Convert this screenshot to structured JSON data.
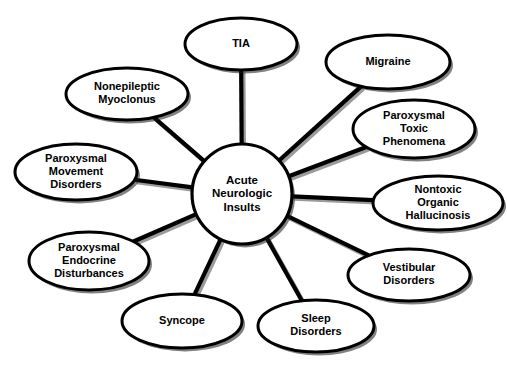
{
  "diagram": {
    "type": "hub-and-spoke-concept-map",
    "background_color": "#ffffff",
    "stroke_color": "#000000",
    "shadow_color": "#1a1a1a",
    "connector_shadow_color": "#8a8a8a",
    "canvas": {
      "width": 507,
      "height": 370
    },
    "hub": {
      "id": "hub-acute-neurologic-insults",
      "label_lines": [
        "Acute",
        "Neurologic",
        "Insults"
      ],
      "label": "Acute Neurologic Insults",
      "shape": "circle",
      "cx": 242,
      "cy": 194,
      "r": 50
    },
    "nodes": [
      {
        "id": "node-tia",
        "label": "TIA",
        "label_lines": [
          "TIA"
        ],
        "shape": "ellipse",
        "cx": 241,
        "cy": 44,
        "rx": 56,
        "ry": 26
      },
      {
        "id": "node-migraine",
        "label": "Migraine",
        "label_lines": [
          "Migraine"
        ],
        "shape": "ellipse",
        "cx": 388,
        "cy": 62,
        "rx": 62,
        "ry": 27
      },
      {
        "id": "node-paroxysmal-toxic-phenomena",
        "label": "Paroxysmal Toxic Phenomena",
        "label_lines": [
          "Paroxysmal",
          "Toxic",
          "Phenomena"
        ],
        "shape": "ellipse",
        "cx": 414,
        "cy": 129,
        "rx": 61,
        "ry": 29
      },
      {
        "id": "node-nontoxic-organic-hallucinosis",
        "label": "Nontoxic Organic Hallucinosis",
        "label_lines": [
          "Nontoxic",
          "Organic",
          "Hallucinosis"
        ],
        "shape": "ellipse",
        "cx": 438,
        "cy": 203,
        "rx": 65,
        "ry": 27
      },
      {
        "id": "node-vestibular-disorders",
        "label": "Vestibular Disorders",
        "label_lines": [
          "Vestibular",
          "Disorders"
        ],
        "shape": "ellipse",
        "cx": 409,
        "cy": 275,
        "rx": 61,
        "ry": 26
      },
      {
        "id": "node-sleep-disorders",
        "label": "Sleep Disorders",
        "label_lines": [
          "Sleep",
          "Disorders"
        ],
        "shape": "ellipse",
        "cx": 316,
        "cy": 326,
        "rx": 58,
        "ry": 26
      },
      {
        "id": "node-syncope",
        "label": "Syncope",
        "label_lines": [
          "Syncope"
        ],
        "shape": "ellipse",
        "cx": 182,
        "cy": 321,
        "rx": 60,
        "ry": 27
      },
      {
        "id": "node-paroxysmal-endocrine-disturbances",
        "label": "Paroxysmal Endocrine Disturbances",
        "label_lines": [
          "Paroxysmal",
          "Endocrine",
          "Disturbances"
        ],
        "shape": "ellipse",
        "cx": 89,
        "cy": 261,
        "rx": 60,
        "ry": 29
      },
      {
        "id": "node-paroxysmal-movement-disorders",
        "label": "Paroxysmal Movement Disorders",
        "label_lines": [
          "Paroxysmal",
          "Movement",
          "Disorders"
        ],
        "shape": "ellipse",
        "cx": 76,
        "cy": 172,
        "rx": 61,
        "ry": 28
      },
      {
        "id": "node-nonepileptic-myoclonus",
        "label": "Nonepileptic Myoclonus",
        "label_lines": [
          "Nonepileptic",
          "Myoclonus"
        ],
        "shape": "ellipse",
        "cx": 127,
        "cy": 94,
        "rx": 61,
        "ry": 26
      }
    ],
    "edges": [
      {
        "id": "edge-hub-tia",
        "from": "hub-acute-neurologic-insults",
        "to": "node-tia"
      },
      {
        "id": "edge-hub-migraine",
        "from": "hub-acute-neurologic-insults",
        "to": "node-migraine"
      },
      {
        "id": "edge-hub-paroxysmal-toxic-phenomena",
        "from": "hub-acute-neurologic-insults",
        "to": "node-paroxysmal-toxic-phenomena"
      },
      {
        "id": "edge-hub-nontoxic-organic-hallucinosis",
        "from": "hub-acute-neurologic-insults",
        "to": "node-nontoxic-organic-hallucinosis"
      },
      {
        "id": "edge-hub-vestibular-disorders",
        "from": "hub-acute-neurologic-insults",
        "to": "node-vestibular-disorders"
      },
      {
        "id": "edge-hub-sleep-disorders",
        "from": "hub-acute-neurologic-insults",
        "to": "node-sleep-disorders"
      },
      {
        "id": "edge-hub-syncope",
        "from": "hub-acute-neurologic-insults",
        "to": "node-syncope"
      },
      {
        "id": "edge-hub-paroxysmal-endocrine-disturbances",
        "from": "hub-acute-neurologic-insults",
        "to": "node-paroxysmal-endocrine-disturbances"
      },
      {
        "id": "edge-hub-paroxysmal-movement-disorders",
        "from": "hub-acute-neurologic-insults",
        "to": "node-paroxysmal-movement-disorders"
      },
      {
        "id": "edge-hub-nonepileptic-myoclonus",
        "from": "hub-acute-neurologic-insults",
        "to": "node-nonepileptic-myoclonus"
      }
    ]
  }
}
